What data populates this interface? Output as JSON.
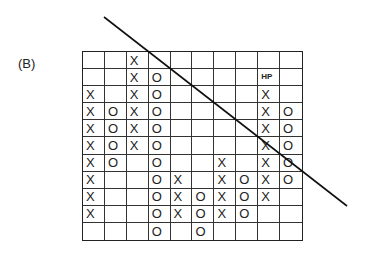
{
  "panel_label": "(B)",
  "chart_data": {
    "type": "point-and-figure",
    "columns": 10,
    "rows": 11,
    "cells": [
      {
        "col": 0,
        "type": "X",
        "rows": [
          2,
          3,
          4,
          5,
          6,
          7,
          8,
          9
        ]
      },
      {
        "col": 1,
        "type": "O",
        "rows": [
          3,
          4,
          5,
          6
        ]
      },
      {
        "col": 2,
        "type": "X",
        "rows": [
          0,
          1,
          2,
          3,
          4,
          5
        ]
      },
      {
        "col": 3,
        "type": "O",
        "rows": [
          1,
          2,
          3,
          4,
          5,
          6,
          7,
          8,
          9,
          10
        ]
      },
      {
        "col": 4,
        "type": "X",
        "rows": [
          7,
          8,
          9
        ]
      },
      {
        "col": 5,
        "type": "O",
        "rows": [
          8,
          9,
          10
        ]
      },
      {
        "col": 6,
        "type": "X",
        "rows": [
          6,
          7,
          8,
          9
        ]
      },
      {
        "col": 7,
        "type": "O",
        "rows": [
          7,
          8,
          9
        ]
      },
      {
        "col": 8,
        "type": "X",
        "rows": [
          2,
          3,
          4,
          5,
          6,
          7,
          8
        ]
      },
      {
        "col": 9,
        "type": "O",
        "rows": [
          3,
          4,
          5,
          6,
          7
        ]
      }
    ],
    "annotations": [
      {
        "text": "HP",
        "col": 8,
        "row": 1
      }
    ],
    "trendline": {
      "x1": 104,
      "y1": 17,
      "x2": 347,
      "y2": 206,
      "direction": "down"
    }
  }
}
